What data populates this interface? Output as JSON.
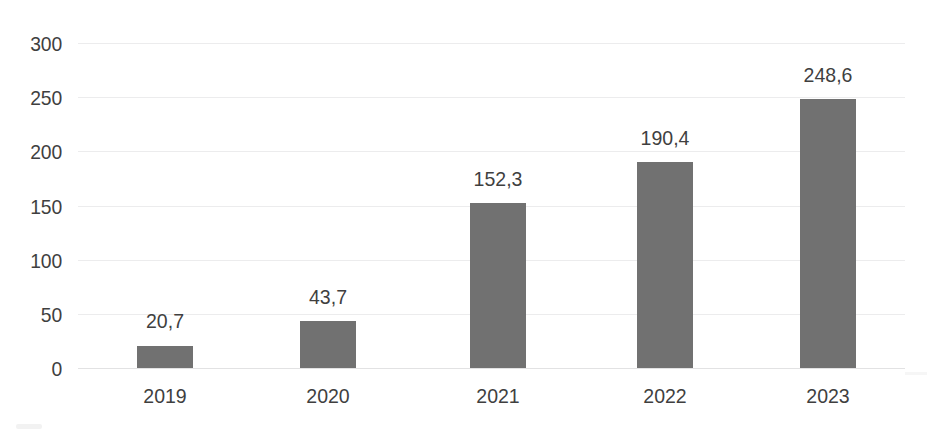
{
  "chart_data": {
    "type": "bar",
    "title": "",
    "subtitle": "",
    "xlabel": "",
    "ylabel": "",
    "categories": [
      "2019",
      "2020",
      "2021",
      "2022",
      "2023"
    ],
    "values": [
      20.7,
      43.7,
      152.3,
      190.4,
      248.6
    ],
    "value_labels": [
      "20,7",
      "43,7",
      "152,3",
      "190,4",
      "248,6"
    ],
    "ylim": [
      0,
      300
    ],
    "ytick_values": [
      0,
      50,
      100,
      150,
      200,
      250,
      300
    ],
    "ytick_labels": [
      "0",
      "50",
      "100",
      "150",
      "200",
      "250",
      "300"
    ],
    "grid": true,
    "grid_axis": "y",
    "legend": "none",
    "series": [
      {
        "name": "",
        "values": [
          20.7,
          43.7,
          152.3,
          190.4,
          248.6
        ]
      }
    ],
    "colors": {
      "bar": "#717171",
      "gridline": "#ececed",
      "baseline": "#e2e2e3",
      "text": "#3f3f3f",
      "background": "#ffffff"
    }
  }
}
